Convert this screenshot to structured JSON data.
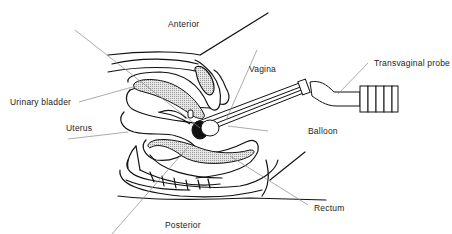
{
  "diagram": {
    "type": "anatomical-cross-section",
    "labels": {
      "anterior": "Anterior",
      "posterior": "Posterior",
      "urinary_bladder": "Urinary bladder",
      "uterus": "Uterus",
      "vagina": "Vagina",
      "transvaginal_probe": "Transvaginal probe",
      "balloon": "Balloon",
      "rectum": "Rectum"
    },
    "colors": {
      "line": "#111111",
      "leader": "#888888",
      "shading": "#cfcfcf",
      "background": "#ffffff"
    }
  }
}
